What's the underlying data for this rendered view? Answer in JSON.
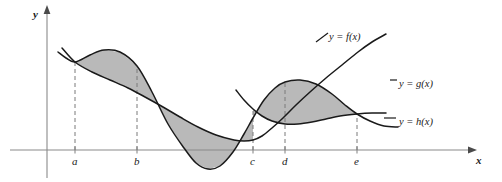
{
  "figure": {
    "type": "math-diagram",
    "background": "#ffffff",
    "curve_color": "#1a1a1a",
    "shade_color": "#b9b9b9",
    "axis_color": "#8a8a8a",
    "dash_color": "#7a7a7a"
  },
  "axes": {
    "y_label": "y",
    "x_label": "x",
    "origin_px": {
      "x": 47,
      "y": 150
    },
    "x_axis_end_px": 468,
    "y_axis_top_px": 14
  },
  "ticks": [
    {
      "label": "a",
      "x_px": 75
    },
    {
      "label": "b",
      "x_px": 137
    },
    {
      "label": "c",
      "x_px": 253
    },
    {
      "label": "d",
      "x_px": 285
    },
    {
      "label": "e",
      "x_px": 357
    }
  ],
  "curve_labels": [
    {
      "name": "f",
      "text": "y = f(x)",
      "x_px": 329,
      "y_px": 31
    },
    {
      "name": "g",
      "text": "y = g(x)",
      "x_px": 399,
      "y_px": 78
    },
    {
      "name": "h",
      "text": "y = h(x)",
      "x_px": 399,
      "y_px": 116
    }
  ],
  "chart_data": {
    "type": "line",
    "title": "",
    "xlabel": "x",
    "ylabel": "y",
    "grid": false,
    "legend": "inline-curve-labels",
    "x_ticks": [
      "a",
      "b",
      "c",
      "d",
      "e"
    ],
    "series": [
      {
        "name": "y = f(x)",
        "shape": "sinusoidal",
        "note": "starts high-left near a, peaks between a and b, falls to deep minimum below axis between b and c, rises through c to a maximum near d, descends to cross h at e",
        "points_px": [
          [
            58,
            52
          ],
          [
            66,
            58
          ],
          [
            75,
            62
          ],
          [
            90,
            55
          ],
          [
            104,
            50
          ],
          [
            120,
            52
          ],
          [
            137,
            66
          ],
          [
            152,
            92
          ],
          [
            168,
            124
          ],
          [
            184,
            148
          ],
          [
            196,
            163
          ],
          [
            208,
            169
          ],
          [
            220,
            166
          ],
          [
            233,
            152
          ],
          [
            244,
            134
          ],
          [
            253,
            118
          ],
          [
            264,
            100
          ],
          [
            275,
            88
          ],
          [
            285,
            82
          ],
          [
            300,
            80
          ],
          [
            316,
            84
          ],
          [
            332,
            94
          ],
          [
            345,
            105
          ],
          [
            357,
            114
          ],
          [
            370,
            121
          ],
          [
            384,
            126
          ],
          [
            398,
            127
          ]
        ]
      },
      {
        "name": "y = g(x)",
        "shape": "rising-curve",
        "note": "descends gently from upper-left crossing f at a, reaches low around b-c region, then rises steadily to the right past e toward its label",
        "points_px": [
          [
            62,
            48
          ],
          [
            75,
            62
          ],
          [
            92,
            72
          ],
          [
            110,
            80
          ],
          [
            128,
            88
          ],
          [
            145,
            97
          ],
          [
            163,
            107
          ],
          [
            180,
            117
          ],
          [
            198,
            127
          ],
          [
            216,
            135
          ],
          [
            234,
            140
          ],
          [
            244,
            141
          ],
          [
            253,
            140
          ],
          [
            262,
            136
          ],
          [
            272,
            128
          ],
          [
            283,
            118
          ],
          [
            296,
            105
          ],
          [
            310,
            92
          ],
          [
            326,
            78
          ],
          [
            342,
            65
          ],
          [
            358,
            52
          ],
          [
            372,
            42
          ],
          [
            386,
            34
          ]
        ]
      },
      {
        "name": "y = h(x)",
        "shape": "parabola",
        "note": "enters from left of c, dips to a minimum near d, then rises slowly to cross f at e and continues right to its label",
        "points_px": [
          [
            236,
            90
          ],
          [
            244,
            100
          ],
          [
            253,
            109
          ],
          [
            262,
            116
          ],
          [
            272,
            121
          ],
          [
            285,
            124
          ],
          [
            298,
            124
          ],
          [
            312,
            122
          ],
          [
            326,
            119
          ],
          [
            340,
            116
          ],
          [
            357,
            114
          ],
          [
            372,
            113
          ],
          [
            386,
            113
          ]
        ]
      }
    ],
    "shaded_regions": [
      {
        "from": "a",
        "to": "b",
        "upper": "f",
        "lower": "g"
      },
      {
        "from": "b",
        "to": "c",
        "upper": "g",
        "lower": "f"
      },
      {
        "from": "c",
        "to": "e",
        "upper": "f",
        "lower": "h"
      }
    ]
  }
}
